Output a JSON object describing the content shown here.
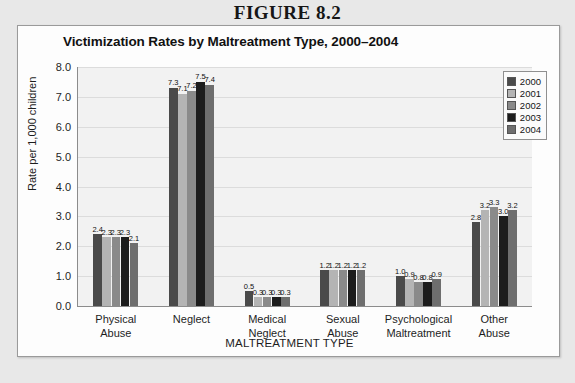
{
  "figure_label": "FIGURE 8.2",
  "x_axis_title": "MALTREATMENT TYPE",
  "colors": {
    "series": [
      "#4a4a4a",
      "#b4b4b4",
      "#8a8a8a",
      "#1c1c1c",
      "#6e6e6e"
    ],
    "plot_background": "#f2f2f2",
    "card_background": "#fdfdfd",
    "page_background": "#e8e8e8",
    "gridline": "#dcdcdc",
    "axis": "#8c8c8c"
  },
  "legend": {
    "position": "top-right",
    "entries": [
      "2000",
      "2001",
      "2002",
      "2003",
      "2004"
    ]
  },
  "chart_data": {
    "type": "bar",
    "title": "Victimization Rates by Maltreatment Type, 2000–2004",
    "xlabel": "MALTREATMENT TYPE",
    "ylabel": "Rate per 1,000 children",
    "ylim": [
      0.0,
      8.0
    ],
    "ytick_labels": [
      "0.0",
      "1.0",
      "2.0",
      "3.0",
      "4.0",
      "5.0",
      "6.0",
      "7.0",
      "8.0"
    ],
    "ytick_values": [
      0.0,
      1.0,
      2.0,
      3.0,
      4.0,
      5.0,
      6.0,
      7.0,
      8.0
    ],
    "grid": true,
    "legend_position": "top-right",
    "categories": [
      "Physical Abuse",
      "Neglect",
      "Medical Neglect",
      "Sexual Abuse",
      "Psychological Maltreatment",
      "Other Abuse"
    ],
    "category_lines": [
      [
        "Physical",
        "Abuse"
      ],
      [
        "Neglect"
      ],
      [
        "Medical",
        "Neglect"
      ],
      [
        "Sexual",
        "Abuse"
      ],
      [
        "Psychological",
        "Maltreatment"
      ],
      [
        "Other",
        "Abuse"
      ]
    ],
    "series": [
      {
        "name": "2000",
        "values": [
          2.4,
          7.3,
          0.5,
          1.2,
          1.0,
          2.8
        ],
        "labels": [
          "2.4",
          "7.3",
          "0.5",
          "1.2",
          "1.0",
          "2.8"
        ]
      },
      {
        "name": "2001",
        "values": [
          2.3,
          7.1,
          0.3,
          1.2,
          0.9,
          3.2
        ],
        "labels": [
          "2.3",
          "7.1",
          "0.3",
          "1.2",
          "0.9",
          "3.2"
        ]
      },
      {
        "name": "2002",
        "values": [
          2.3,
          7.2,
          0.3,
          1.2,
          0.8,
          3.3
        ],
        "labels": [
          "2.3",
          "7.2",
          "0.3",
          "1.2",
          "0.8",
          "3.3"
        ]
      },
      {
        "name": "2003",
        "values": [
          2.3,
          7.5,
          0.3,
          1.2,
          0.8,
          3.0
        ],
        "labels": [
          "2.3",
          "7.5",
          "0.3",
          "1.2",
          "0.8",
          "3.0"
        ]
      },
      {
        "name": "2004",
        "values": [
          2.1,
          7.4,
          0.3,
          1.2,
          0.9,
          3.2
        ],
        "labels": [
          "2.1",
          "7.4",
          "0.3",
          "1.2",
          "0.9",
          "3.2"
        ]
      }
    ]
  }
}
